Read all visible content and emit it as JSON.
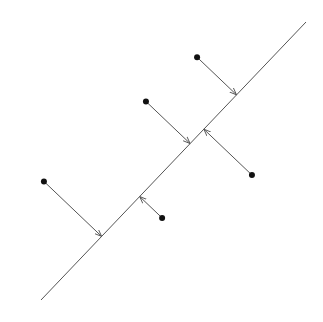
{
  "diagram": {
    "colors": {
      "line": "#555555",
      "arrow": "#555555",
      "point": "#111111",
      "background": "#ffffff"
    },
    "line": {
      "label": "projection-line",
      "from": [
        0.0,
        0.0
      ],
      "to": [
        10.0,
        10.5
      ]
    },
    "points": [
      {
        "id": "p1",
        "x": 0.11,
        "y": 4.48,
        "side": "above"
      },
      {
        "id": "p2",
        "x": 3.96,
        "y": 7.5,
        "side": "above"
      },
      {
        "id": "p3",
        "x": 5.89,
        "y": 9.17,
        "side": "above"
      },
      {
        "id": "p4",
        "x": 7.96,
        "y": 4.72,
        "side": "below"
      },
      {
        "id": "p5",
        "x": 4.57,
        "y": 3.1,
        "side": "below"
      }
    ]
  }
}
